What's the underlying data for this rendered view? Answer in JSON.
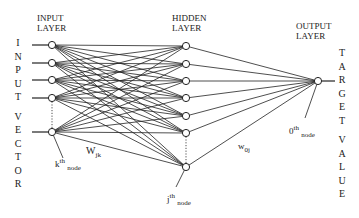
{
  "diagram": {
    "type": "neural-network",
    "layers": {
      "input": {
        "title_line1": "INPUT",
        "title_line2": "LAYER"
      },
      "hidden": {
        "title_line1": "HIDDEN",
        "title_line2": "LAYER"
      },
      "output": {
        "title_line1": "OUTPUT",
        "title_line2": "LAYER"
      }
    },
    "side_labels": {
      "left": [
        "I",
        "N",
        "P",
        "U",
        "T",
        "",
        "V",
        "E",
        "C",
        "T",
        "O",
        "R"
      ],
      "right": [
        "T",
        "A",
        "R",
        "G",
        "E",
        "T",
        "",
        "V",
        "A",
        "L",
        "U",
        "E"
      ]
    },
    "annotations": {
      "k_node": {
        "base": "k",
        "sup": "th",
        "sub": "node"
      },
      "j_node": {
        "base": "j",
        "sup": "th",
        "sub": "node"
      },
      "o_node": {
        "base": "0",
        "sup": "th",
        "sub": "node"
      },
      "w_jk": {
        "base": "W",
        "sub": "jk"
      },
      "w_0j": {
        "base": "w",
        "sub": "0j"
      }
    },
    "nodes": {
      "input": [
        {
          "x": 52,
          "y": 45
        },
        {
          "x": 52,
          "y": 63
        },
        {
          "x": 52,
          "y": 80
        },
        {
          "x": 52,
          "y": 98
        },
        {
          "x": 52,
          "y": 132
        }
      ],
      "hidden": [
        {
          "x": 186,
          "y": 46
        },
        {
          "x": 186,
          "y": 64
        },
        {
          "x": 186,
          "y": 81
        },
        {
          "x": 186,
          "y": 98
        },
        {
          "x": 186,
          "y": 116
        },
        {
          "x": 186,
          "y": 133
        },
        {
          "x": 186,
          "y": 167
        }
      ],
      "output": [
        {
          "x": 318,
          "y": 81
        }
      ]
    },
    "colors": {
      "line": "#222222",
      "background": "#ffffff"
    }
  }
}
